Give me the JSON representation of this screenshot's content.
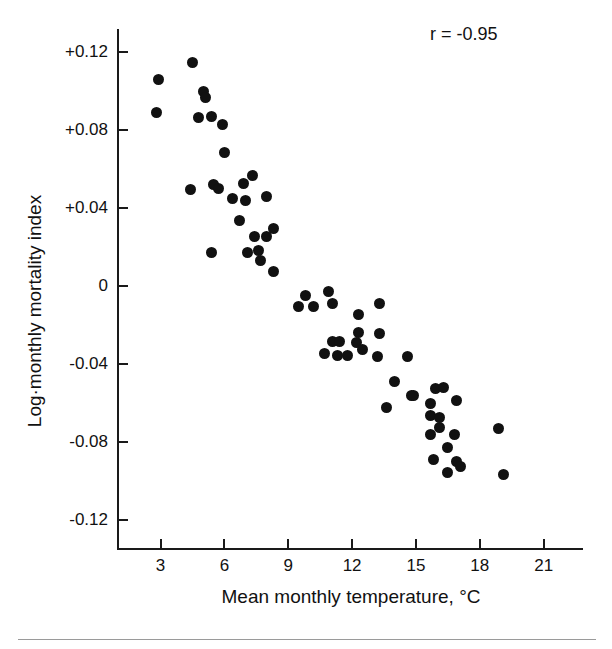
{
  "chart_data": {
    "type": "scatter",
    "title": "",
    "xlabel": "Mean monthly temperature, °C",
    "ylabel": "Log·monthly mortality index",
    "xlim": [
      1.0,
      22.8
    ],
    "ylim": [
      -0.135,
      0.132
    ],
    "grid": false,
    "legend": null,
    "annotations": [
      {
        "text": "r = -0.95",
        "position": "top-right"
      }
    ],
    "xticks": [
      3,
      6,
      9,
      12,
      15,
      18,
      21
    ],
    "xtick_labels": [
      "3",
      "6",
      "9",
      "12",
      "15",
      "18",
      "21"
    ],
    "yticks": [
      0.12,
      0.08,
      0.04,
      0,
      -0.04,
      -0.08,
      -0.12
    ],
    "ytick_labels": [
      "+0.12",
      "+0.08",
      "+0.04",
      "0",
      "-0.04",
      "-0.08",
      "-0.12"
    ],
    "marker": {
      "shape": "circle",
      "color": "#111111",
      "size": 11
    },
    "correlation": -0.95,
    "n_points": 62,
    "points": [
      {
        "x": 4.5,
        "y": 0.1148
      },
      {
        "x": 2.9,
        "y": 0.1063
      },
      {
        "x": 5.0,
        "y": 0.1
      },
      {
        "x": 5.1,
        "y": 0.0969
      },
      {
        "x": 2.8,
        "y": 0.0892
      },
      {
        "x": 4.8,
        "y": 0.0866
      },
      {
        "x": 5.4,
        "y": 0.0871
      },
      {
        "x": 5.9,
        "y": 0.083
      },
      {
        "x": 6.0,
        "y": 0.0687
      },
      {
        "x": 7.3,
        "y": 0.0569
      },
      {
        "x": 6.9,
        "y": 0.0528
      },
      {
        "x": 5.5,
        "y": 0.0523
      },
      {
        "x": 5.7,
        "y": 0.0503
      },
      {
        "x": 6.4,
        "y": 0.0451
      },
      {
        "x": 7.0,
        "y": 0.0441
      },
      {
        "x": 8.0,
        "y": 0.0461
      },
      {
        "x": 4.4,
        "y": 0.0497
      },
      {
        "x": 6.7,
        "y": 0.0338
      },
      {
        "x": 7.4,
        "y": 0.0256
      },
      {
        "x": 8.0,
        "y": 0.0256
      },
      {
        "x": 8.3,
        "y": 0.0297
      },
      {
        "x": 5.4,
        "y": 0.0174
      },
      {
        "x": 7.1,
        "y": 0.0174
      },
      {
        "x": 7.6,
        "y": 0.0184
      },
      {
        "x": 7.7,
        "y": 0.0133
      },
      {
        "x": 8.3,
        "y": 0.0077
      },
      {
        "x": 9.8,
        "y": -0.0046
      },
      {
        "x": 9.5,
        "y": -0.0103
      },
      {
        "x": 10.9,
        "y": -0.0026
      },
      {
        "x": 10.2,
        "y": -0.0103
      },
      {
        "x": 11.1,
        "y": -0.0087
      },
      {
        "x": 13.3,
        "y": -0.0087
      },
      {
        "x": 12.3,
        "y": -0.0144
      },
      {
        "x": 13.3,
        "y": -0.0246
      },
      {
        "x": 12.3,
        "y": -0.0236
      },
      {
        "x": 11.1,
        "y": -0.0287
      },
      {
        "x": 11.4,
        "y": -0.0287
      },
      {
        "x": 12.2,
        "y": -0.0292
      },
      {
        "x": 10.7,
        "y": -0.0344
      },
      {
        "x": 11.3,
        "y": -0.0359
      },
      {
        "x": 11.8,
        "y": -0.0354
      },
      {
        "x": 12.5,
        "y": -0.0328
      },
      {
        "x": 13.2,
        "y": -0.0364
      },
      {
        "x": 14.6,
        "y": -0.0364
      },
      {
        "x": 14.0,
        "y": -0.0492
      },
      {
        "x": 14.8,
        "y": -0.0564
      },
      {
        "x": 13.6,
        "y": -0.0626
      },
      {
        "x": 14.9,
        "y": -0.0564
      },
      {
        "x": 15.9,
        "y": -0.0528
      },
      {
        "x": 16.3,
        "y": -0.0523
      },
      {
        "x": 15.7,
        "y": -0.0605
      },
      {
        "x": 16.9,
        "y": -0.059
      },
      {
        "x": 15.7,
        "y": -0.0667
      },
      {
        "x": 16.1,
        "y": -0.0677
      },
      {
        "x": 16.1,
        "y": -0.0728
      },
      {
        "x": 15.7,
        "y": -0.0764
      },
      {
        "x": 16.8,
        "y": -0.0764
      },
      {
        "x": 16.5,
        "y": -0.0831
      },
      {
        "x": 15.8,
        "y": -0.0892
      },
      {
        "x": 16.9,
        "y": -0.0903
      },
      {
        "x": 17.1,
        "y": -0.0928
      },
      {
        "x": 16.5,
        "y": -0.0959
      },
      {
        "x": 18.9,
        "y": -0.0733
      },
      {
        "x": 19.1,
        "y": -0.0969
      }
    ]
  }
}
